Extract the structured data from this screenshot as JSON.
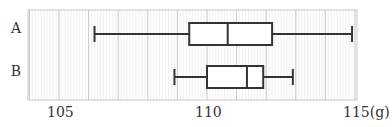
{
  "chart_data": {
    "type": "boxplot",
    "title": "",
    "xlabel": "",
    "unit": "(g)",
    "xlim": [
      104,
      115
    ],
    "orientation": "horizontal",
    "grid": {
      "major_step": 1,
      "minor_step": 0.1,
      "on": true
    },
    "tick_labels": [
      "105",
      "110",
      "115(g)"
    ],
    "tick_values": [
      105,
      110,
      115
    ],
    "categories": [
      "A",
      "B"
    ],
    "series": [
      {
        "name": "A",
        "min": 106.2,
        "q1": 109.4,
        "median": 110.7,
        "q3": 112.2,
        "max": 114.9
      },
      {
        "name": "B",
        "min": 108.9,
        "q1": 110.0,
        "median": 111.35,
        "q3": 111.9,
        "max": 112.9
      }
    ]
  },
  "colors": {
    "box_stroke": "#333333",
    "major_grid": "#c8c8c8",
    "minor_grid": "#e6e6e6",
    "frame": "#c8c8c8"
  }
}
